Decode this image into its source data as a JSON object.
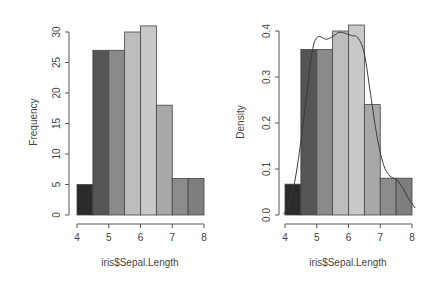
{
  "chart_data": [
    {
      "type": "bar",
      "subtype": "histogram",
      "title": "",
      "xlabel": "iris$Sepal.Length",
      "ylabel": "Frequency",
      "bins": [
        [
          4.0,
          4.5
        ],
        [
          4.5,
          5.0
        ],
        [
          5.0,
          5.5
        ],
        [
          5.5,
          6.0
        ],
        [
          6.0,
          6.5
        ],
        [
          6.5,
          7.0
        ],
        [
          7.0,
          7.5
        ],
        [
          7.5,
          8.0
        ]
      ],
      "categories": [
        "4.0-4.5",
        "4.5-5.0",
        "5.0-5.5",
        "5.5-6.0",
        "6.0-6.5",
        "6.5-7.0",
        "7.0-7.5",
        "7.5-8.0"
      ],
      "values": [
        5,
        27,
        27,
        30,
        31,
        18,
        6,
        6
      ],
      "bar_colors": [
        "#2b2b2b",
        "#555555",
        "#8a8a8a",
        "#bdbdbd",
        "#c8c8c8",
        "#a8a8a8",
        "#8c8c8c",
        "#7e7e7e"
      ],
      "xlim": [
        4,
        8
      ],
      "ylim": [
        0,
        31
      ],
      "xticks": [
        4,
        5,
        6,
        7,
        8
      ],
      "yticks": [
        0,
        5,
        10,
        15,
        20,
        25,
        30
      ],
      "grid": false,
      "legend": null
    },
    {
      "type": "bar",
      "subtype": "histogram-density",
      "title": "",
      "xlabel": "iris$Sepal.Length",
      "ylabel": "Density",
      "bins": [
        [
          4.0,
          4.5
        ],
        [
          4.5,
          5.0
        ],
        [
          5.0,
          5.5
        ],
        [
          5.5,
          6.0
        ],
        [
          6.0,
          6.5
        ],
        [
          6.5,
          7.0
        ],
        [
          7.0,
          7.5
        ],
        [
          7.5,
          8.0
        ]
      ],
      "categories": [
        "4.0-4.5",
        "4.5-5.0",
        "5.0-5.5",
        "5.5-6.0",
        "6.0-6.5",
        "6.5-7.0",
        "7.0-7.5",
        "7.5-8.0"
      ],
      "values": [
        0.067,
        0.36,
        0.36,
        0.4,
        0.413,
        0.24,
        0.08,
        0.08
      ],
      "bar_colors": [
        "#2b2b2b",
        "#555555",
        "#8a8a8a",
        "#bdbdbd",
        "#c8c8c8",
        "#a8a8a8",
        "#8c8c8c",
        "#7e7e7e"
      ],
      "density_curve": {
        "x": [
          3.95,
          4.1,
          4.3,
          4.5,
          4.7,
          4.8,
          4.9,
          5.0,
          5.1,
          5.3,
          5.5,
          5.7,
          5.9,
          6.1,
          6.3,
          6.5,
          6.7,
          6.9,
          7.1,
          7.3,
          7.5,
          7.7,
          7.9,
          8.1
        ],
        "y": [
          0.002,
          0.02,
          0.07,
          0.16,
          0.27,
          0.33,
          0.37,
          0.385,
          0.388,
          0.382,
          0.388,
          0.397,
          0.395,
          0.39,
          0.385,
          0.35,
          0.26,
          0.17,
          0.11,
          0.085,
          0.077,
          0.06,
          0.035,
          0.015
        ]
      },
      "xlim": [
        4,
        8
      ],
      "ylim": [
        0,
        0.413
      ],
      "xticks": [
        4,
        5,
        6,
        7,
        8
      ],
      "yticks": [
        0.0,
        0.1,
        0.2,
        0.3,
        0.4
      ],
      "ytick_labels": [
        "0.0",
        "0.1",
        "0.2",
        "0.3",
        "0.4"
      ],
      "grid": false,
      "legend": null
    }
  ],
  "plots": {
    "left": {
      "ylabel": "Frequency",
      "xlabel": "iris$Sepal.Length",
      "xtick_labels": [
        "4",
        "5",
        "6",
        "7",
        "8"
      ],
      "ytick_labels": [
        "0",
        "5",
        "10",
        "15",
        "20",
        "25",
        "30"
      ]
    },
    "right": {
      "ylabel": "Density",
      "xlabel": "iris$Sepal.Length",
      "xtick_labels": [
        "4",
        "5",
        "6",
        "7",
        "8"
      ],
      "ytick_labels": [
        "0.0",
        "0.1",
        "0.2",
        "0.3",
        "0.4"
      ]
    }
  }
}
